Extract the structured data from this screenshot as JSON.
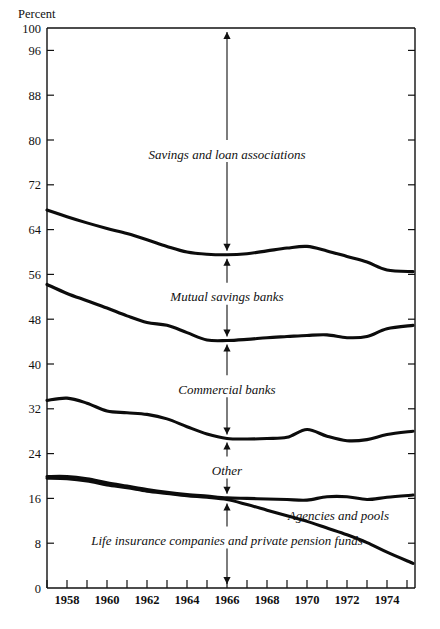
{
  "chart_data": {
    "type": "line",
    "title": "",
    "subtitle": "",
    "xlabel": "",
    "ylabel": "Percent",
    "ylim": [
      0,
      100
    ],
    "xlim": [
      1957,
      1975.4
    ],
    "grid": false,
    "legend_position": "inline-annotations",
    "y_ticks": [
      0,
      8,
      16,
      24,
      32,
      40,
      48,
      56,
      64,
      72,
      80,
      88,
      96,
      100
    ],
    "y_tick_labels": [
      "0",
      "8",
      "16",
      "24",
      "32",
      "40",
      "48",
      "56",
      "64",
      "72",
      "80",
      "88",
      "96",
      "100"
    ],
    "x_ticks": [
      1957,
      1958,
      1959,
      1960,
      1961,
      1962,
      1963,
      1964,
      1965,
      1966,
      1967,
      1968,
      1969,
      1970,
      1971,
      1972,
      1973,
      1974,
      1975
    ],
    "x_tick_labels": [
      "",
      "1958",
      "",
      "1960",
      "",
      "1962",
      "",
      "1964",
      "",
      "1966",
      "",
      "1968",
      "",
      "1970",
      "",
      "1972",
      "",
      "1974",
      ""
    ],
    "x": [
      1957,
      1958,
      1959,
      1960,
      1961,
      1962,
      1963,
      1964,
      1965,
      1966,
      1967,
      1968,
      1969,
      1970,
      1971,
      1972,
      1973,
      1974,
      1975.3
    ],
    "series": [
      {
        "name": "cumulative-top-boundary",
        "label": "Savings and loan associations upper boundary",
        "values": [
          67.5,
          66.3,
          65.2,
          64.2,
          63.3,
          62.2,
          61.0,
          60.0,
          59.6,
          59.5,
          59.7,
          60.2,
          60.7,
          61.0,
          60.2,
          59.2,
          58.2,
          56.8,
          56.5
        ]
      },
      {
        "name": "cumulative-mutual-savings-boundary",
        "label": "Mutual savings banks upper boundary",
        "values": [
          54.2,
          52.6,
          51.3,
          50.0,
          48.6,
          47.4,
          46.9,
          45.6,
          44.3,
          44.2,
          44.4,
          44.7,
          44.9,
          45.1,
          45.2,
          44.7,
          44.9,
          46.3,
          46.9
        ]
      },
      {
        "name": "cumulative-commercial-banks-boundary",
        "label": "Commercial banks upper boundary",
        "values": [
          33.5,
          33.9,
          33.0,
          31.6,
          31.3,
          31.0,
          30.2,
          28.8,
          27.5,
          26.7,
          26.6,
          26.7,
          26.9,
          28.3,
          27.1,
          26.3,
          26.5,
          27.4,
          28.0
        ]
      },
      {
        "name": "cumulative-other-boundary",
        "label": "Other upper boundary",
        "values": [
          19.9,
          19.9,
          19.5,
          18.8,
          18.2,
          17.6,
          17.1,
          16.7,
          16.4,
          16.1,
          16.0,
          15.9,
          15.8,
          15.7,
          16.3,
          16.3,
          15.8,
          16.2,
          16.6
        ]
      },
      {
        "name": "cumulative-agencies-and-pools-boundary",
        "label": "Agencies and pools upper boundary",
        "values": [
          19.6,
          19.5,
          19.1,
          18.4,
          17.9,
          17.3,
          16.9,
          16.5,
          16.2,
          15.8,
          14.9,
          13.9,
          12.9,
          11.9,
          10.7,
          9.5,
          8.1,
          6.4,
          4.4
        ]
      }
    ],
    "band_annotations": [
      {
        "name": "savings-and-loan-associations",
        "label": "Savings and loan associations",
        "upper": 100,
        "lower": 59.5,
        "label_value": 77.5
      },
      {
        "name": "mutual-savings-banks",
        "label": "Mutual savings banks",
        "upper": 59.5,
        "lower": 44.2,
        "label_value": 52.0
      },
      {
        "name": "commercial-banks",
        "label": "Commercial banks",
        "upper": 44.2,
        "lower": 26.7,
        "label_value": 35.5
      },
      {
        "name": "other",
        "label": "Other",
        "upper": 26.7,
        "lower": 16.1,
        "label_value": 21.0
      },
      {
        "name": "life-insurance-companies-and-private-pension-funds",
        "label": "Life insurance companies and private pension funds",
        "upper": 15.8,
        "lower": 0,
        "label_value": 8.5
      }
    ],
    "floating_labels": [
      {
        "name": "agencies-and-pools",
        "label": "Agencies and pools",
        "x": 1973.6,
        "y": 13.0
      }
    ],
    "annotation_axis_year": 1966,
    "colors": {
      "line": "#0c0c0c",
      "axis": "#111111",
      "background": "#ffffff"
    }
  }
}
